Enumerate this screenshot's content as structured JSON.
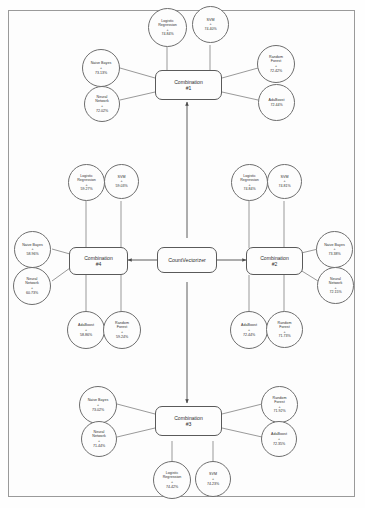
{
  "diagram": {
    "root": {
      "label": "CountVectorizer",
      "name": "countvectorizer-node"
    },
    "plus_symbol": "+",
    "stroke_color": "#6e6e6e",
    "border_color": "#9a9a9a",
    "combinations": [
      {
        "id": "combination-1",
        "label": "Combination",
        "sub": "#1",
        "position": "top",
        "members": [
          {
            "slot": "top-left",
            "name": "Logistic\nRegression",
            "score": "74.84%"
          },
          {
            "slot": "top-right",
            "name": "SVM",
            "score": "74.40%"
          },
          {
            "slot": "left-upper",
            "name": "Naive Bayes",
            "score": "73.13%"
          },
          {
            "slot": "left-lower",
            "name": "Neural\nNetwork",
            "score": "72.02%"
          },
          {
            "slot": "right-upper",
            "name": "Random\nForest",
            "score": "72.42%"
          },
          {
            "slot": "right-lower",
            "name": "AdaBoost",
            "score": "72.44%"
          }
        ]
      },
      {
        "id": "combination-4",
        "label": "Combination",
        "sub": "#4",
        "position": "left",
        "members": [
          {
            "slot": "top-left",
            "name": "Logistic\nRegression",
            "score": "59.27%"
          },
          {
            "slot": "top-right",
            "name": "SVM",
            "score": "59.03%"
          },
          {
            "slot": "left-upper",
            "name": "Naive Bayes",
            "score": "58.96%"
          },
          {
            "slot": "left-lower",
            "name": "Neural\nNetwork",
            "score": "60.73%"
          },
          {
            "slot": "bottom-left",
            "name": "AdaBoost",
            "score": "58.86%"
          },
          {
            "slot": "bottom-right",
            "name": "Random\nForest",
            "score": "59.24%"
          }
        ]
      },
      {
        "id": "combination-2",
        "label": "Combination",
        "sub": "#2",
        "position": "right",
        "members": [
          {
            "slot": "top-left",
            "name": "Logistic\nRegression",
            "score": "74.84%"
          },
          {
            "slot": "top-right",
            "name": "SVM",
            "score": "74.81%"
          },
          {
            "slot": "right-upper",
            "name": "Naive Bayes",
            "score": "73.38%"
          },
          {
            "slot": "right-lower",
            "name": "Neural\nNetwork",
            "score": "72.15%"
          },
          {
            "slot": "bottom-left",
            "name": "AdaBoost",
            "score": "72.44%"
          },
          {
            "slot": "bottom-right",
            "name": "Random\nForest",
            "score": "71.73%"
          }
        ]
      },
      {
        "id": "combination-3",
        "label": "Combination",
        "sub": "#3",
        "position": "bottom",
        "members": [
          {
            "slot": "left-upper",
            "name": "Naive Bayes",
            "score": "73.02%"
          },
          {
            "slot": "left-lower",
            "name": "Neural\nNetwork",
            "score": "71.44%"
          },
          {
            "slot": "right-upper",
            "name": "Random\nForest",
            "score": "71.92%"
          },
          {
            "slot": "right-lower",
            "name": "AdaBoost",
            "score": "72.35%"
          },
          {
            "slot": "bottom-left",
            "name": "Logistic\nRegression",
            "score": "74.42%"
          },
          {
            "slot": "bottom-right",
            "name": "SVM",
            "score": "74.23%"
          }
        ]
      }
    ]
  }
}
